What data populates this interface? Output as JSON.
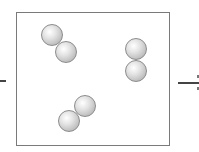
{
  "diagram": {
    "colors": {
      "box_border": "#7a7a7a",
      "atom_fill": "#c8c8c8",
      "line": "#444444"
    },
    "molecules": [
      {
        "name": "molecule-top-left",
        "atoms": [
          {
            "x": 41,
            "y": 24
          },
          {
            "x": 55,
            "y": 41
          }
        ]
      },
      {
        "name": "molecule-right",
        "atoms": [
          {
            "x": 125,
            "y": 38
          },
          {
            "x": 125,
            "y": 60
          }
        ]
      },
      {
        "name": "molecule-bottom",
        "atoms": [
          {
            "x": 74,
            "y": 95
          },
          {
            "x": 58,
            "y": 110
          }
        ]
      }
    ]
  }
}
